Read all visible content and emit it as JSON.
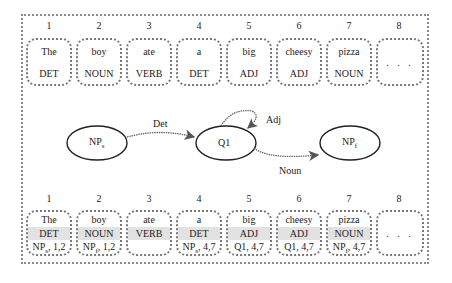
{
  "top_row": {
    "cells": [
      {
        "index": "1",
        "word": "The",
        "tag": "DET"
      },
      {
        "index": "2",
        "word": "boy",
        "tag": "NOUN"
      },
      {
        "index": "3",
        "word": "ate",
        "tag": "VERB"
      },
      {
        "index": "4",
        "word": "a",
        "tag": "DET"
      },
      {
        "index": "5",
        "word": "big",
        "tag": "ADJ"
      },
      {
        "index": "6",
        "word": "cheesy",
        "tag": "ADJ"
      },
      {
        "index": "7",
        "word": "pizza",
        "tag": "NOUN"
      },
      {
        "index": "8",
        "word": "",
        "tag": "",
        "ellipsis": ". . ."
      }
    ]
  },
  "automaton": {
    "states": [
      {
        "id": "NPs",
        "label": "NP",
        "sub": "s"
      },
      {
        "id": "Q1",
        "label": "Q1",
        "sub": ""
      },
      {
        "id": "NPf",
        "label": "NP",
        "sub": "f"
      }
    ],
    "transitions": [
      {
        "from": "NPs",
        "to": "Q1",
        "label": "Det"
      },
      {
        "from": "Q1",
        "to": "Q1",
        "label": "Adj"
      },
      {
        "from": "Q1",
        "to": "NPf",
        "label": "Noun"
      }
    ]
  },
  "bottom_row": {
    "cells": [
      {
        "index": "1",
        "word": "The",
        "tag": "DET",
        "ann_state": "NP",
        "ann_sub": "s",
        "ann_span": ", 1,2"
      },
      {
        "index": "2",
        "word": "boy",
        "tag": "NOUN",
        "ann_state": "NP",
        "ann_sub": "f",
        "ann_span": ", 1,2"
      },
      {
        "index": "3",
        "word": "ate",
        "tag": "VERB",
        "ann_state": "",
        "ann_sub": "",
        "ann_span": ""
      },
      {
        "index": "4",
        "word": "a",
        "tag": "DET",
        "ann_state": "NP",
        "ann_sub": "s",
        "ann_span": ", 4,7"
      },
      {
        "index": "5",
        "word": "big",
        "tag": "ADJ",
        "ann_state": "Q1",
        "ann_sub": "",
        "ann_span": ", 4,7"
      },
      {
        "index": "6",
        "word": "cheesy",
        "tag": "ADJ",
        "ann_state": "Q1",
        "ann_sub": "",
        "ann_span": ", 4,7"
      },
      {
        "index": "7",
        "word": "pizza",
        "tag": "NOUN",
        "ann_state": "NP",
        "ann_sub": "f",
        "ann_span": ", 4,7"
      },
      {
        "index": "8",
        "word": "",
        "tag": "",
        "ellipsis": ". . ."
      }
    ]
  }
}
